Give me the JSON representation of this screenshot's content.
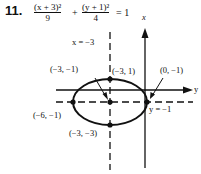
{
  "problem": {
    "number": "11.",
    "equation": {
      "term1_numerator": "(x + 3)²",
      "term1_denominator": "9",
      "plus": "+",
      "term2_numerator": "(y + 1)²",
      "term2_denominator": "4",
      "equals": "= 1"
    }
  },
  "graph": {
    "vertical_axis_label": "x",
    "horizontal_axis_label": "y",
    "vertical_dashed_line_label": "x = −3",
    "horizontal_dashed_line_label": "y = −1",
    "points": [
      {
        "label": "(−3, −1)",
        "role": "center"
      },
      {
        "label": "(−3, 1)",
        "role": "top-vertex"
      },
      {
        "label": "(0, −1)",
        "role": "right-vertex"
      },
      {
        "label": "(−6, −1)",
        "role": "left-vertex"
      },
      {
        "label": "(−3, −3)",
        "role": "bottom-vertex"
      }
    ],
    "ellipse": {
      "center": "(−3, −1)",
      "a": 3,
      "b": 2
    },
    "stroke_color": "#111111"
  }
}
